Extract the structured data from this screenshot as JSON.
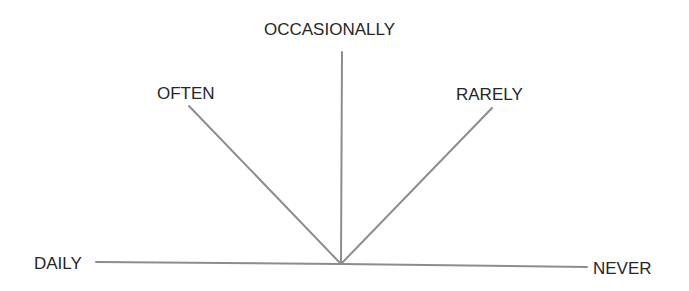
{
  "diagram": {
    "type": "frequency-scale-fan",
    "line_color": "#8c8c8c",
    "text_color": "#262626",
    "origin": {
      "x": 341,
      "y": 264
    },
    "labels": {
      "occasionally": "OCCASIONALLY",
      "often": "OFTEN",
      "rarely": "RARELY",
      "daily": "DAILY",
      "never": "NEVER"
    },
    "rays": [
      {
        "name": "daily",
        "label": "DAILY",
        "x2": 96,
        "y2": 262
      },
      {
        "name": "often",
        "label": "OFTEN",
        "x2": 189,
        "y2": 106
      },
      {
        "name": "occasionally",
        "label": "OCCASIONALLY",
        "x2": 342,
        "y2": 52
      },
      {
        "name": "rarely",
        "label": "RARELY",
        "x2": 492,
        "y2": 108
      },
      {
        "name": "never",
        "label": "NEVER",
        "x2": 587,
        "y2": 267
      }
    ]
  }
}
